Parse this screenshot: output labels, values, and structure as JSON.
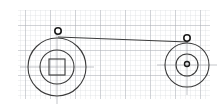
{
  "figure": {
    "type": "engineering-sketch",
    "width": 223,
    "height": 110,
    "background_color": "#ffffff"
  },
  "grid": {
    "name": "graph-paper-grid",
    "minor_spacing": 5,
    "major_spacing": 25,
    "minor_color": "#d8dce0",
    "major_color": "#a8adb4",
    "region": {
      "x": 18,
      "y": 10,
      "width": 192,
      "height": 89
    }
  },
  "drawing": {
    "line_color": "#3a3a3a",
    "accent_color": "#1a1a1a",
    "axis_color": "#9aa0a6",
    "stroke_width": 1
  },
  "components": [
    {
      "id": "driver-pulley",
      "label": "Large pulley",
      "center_x": 57,
      "center_y": 67,
      "outer_radius": 29,
      "hub_radius": 17,
      "bore_type": "square",
      "bore_size": 16
    },
    {
      "id": "driven-pulley",
      "label": "Small pulley",
      "center_x": 187,
      "center_y": 65,
      "outer_radius": 22,
      "hub_radius": 11,
      "bore_type": "round",
      "bore_size": 5
    }
  ],
  "belt": {
    "id": "drive-belt",
    "label": "Belt",
    "start_x": 58,
    "start_y": 37,
    "end_x": 188,
    "end_y": 42,
    "color": "#3a3a3a"
  },
  "markers": [
    {
      "id": "marker-left",
      "label": "Tangent point A",
      "x": 58,
      "y": 31,
      "radius": 3.2
    },
    {
      "id": "marker-right",
      "label": "Tangent point B",
      "x": 187,
      "y": 38,
      "radius": 3.2
    }
  ]
}
